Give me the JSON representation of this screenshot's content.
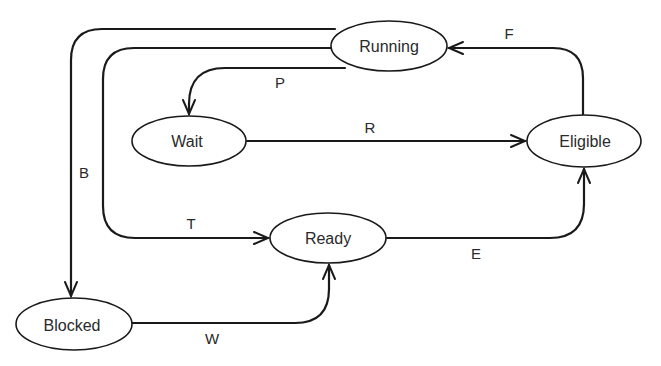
{
  "diagram": {
    "type": "state-transition",
    "nodes": {
      "running": {
        "label": "Running"
      },
      "wait": {
        "label": "Wait"
      },
      "eligible": {
        "label": "Eligible"
      },
      "ready": {
        "label": "Ready"
      },
      "blocked": {
        "label": "Blocked"
      }
    },
    "edges": {
      "f": {
        "label": "F",
        "from": "Eligible",
        "to": "Running"
      },
      "p": {
        "label": "P",
        "from": "Running",
        "to": "Wait"
      },
      "r": {
        "label": "R",
        "from": "Wait",
        "to": "Eligible"
      },
      "b": {
        "label": "B",
        "from": "Running",
        "to": "Blocked"
      },
      "t": {
        "label": "T",
        "from": "Running",
        "to": "Ready"
      },
      "e": {
        "label": "E",
        "from": "Ready",
        "to": "Eligible"
      },
      "w": {
        "label": "W",
        "from": "Blocked",
        "to": "Ready"
      }
    }
  }
}
